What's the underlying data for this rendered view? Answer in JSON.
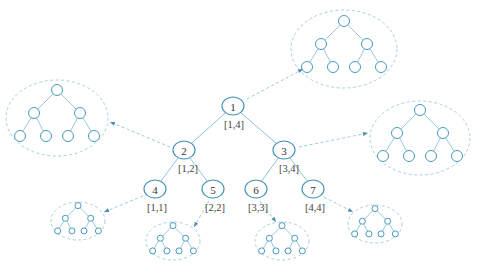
{
  "diagram": {
    "type": "segment-tree",
    "colors": {
      "node_stroke": "#3e8fb8",
      "edge": "#8cc4d6",
      "ellipse_dashed": "#9cc9d8",
      "text": "#333333"
    },
    "nodes": [
      {
        "id": "1",
        "label": "1",
        "range": "[1,4]",
        "x": 233,
        "y": 106
      },
      {
        "id": "2",
        "label": "2",
        "range": "[1,2]",
        "x": 184,
        "y": 150
      },
      {
        "id": "3",
        "label": "3",
        "range": "[3,4]",
        "x": 284,
        "y": 150
      },
      {
        "id": "4",
        "label": "4",
        "range": "[1,1]",
        "x": 155,
        "y": 189
      },
      {
        "id": "5",
        "label": "5",
        "range": "[2,2]",
        "x": 213,
        "y": 189
      },
      {
        "id": "6",
        "label": "6",
        "range": "[3,3]",
        "x": 256,
        "y": 189
      },
      {
        "id": "7",
        "label": "7",
        "range": "[4,4]",
        "x": 313,
        "y": 189
      }
    ],
    "edges": [
      [
        "1",
        "2"
      ],
      [
        "1",
        "3"
      ],
      [
        "2",
        "4"
      ],
      [
        "2",
        "5"
      ],
      [
        "3",
        "6"
      ],
      [
        "3",
        "7"
      ]
    ],
    "inner_trees": [
      {
        "attached_to": "1",
        "cx": 344,
        "cy": 49,
        "rx": 53,
        "ry": 39,
        "scale": 1.0
      },
      {
        "attached_to": "2",
        "cx": 57,
        "cy": 118,
        "rx": 51,
        "ry": 38,
        "scale": 1.0
      },
      {
        "attached_to": "3",
        "cx": 420,
        "cy": 138,
        "rx": 50,
        "ry": 37,
        "scale": 1.0
      },
      {
        "attached_to": "4",
        "cx": 78,
        "cy": 221,
        "rx": 27,
        "ry": 19,
        "scale": 0.55
      },
      {
        "attached_to": "5",
        "cx": 173,
        "cy": 241,
        "rx": 27,
        "ry": 19,
        "scale": 0.55
      },
      {
        "attached_to": "6",
        "cx": 282,
        "cy": 241,
        "rx": 27,
        "ry": 19,
        "scale": 0.55
      },
      {
        "attached_to": "7",
        "cx": 375,
        "cy": 224,
        "rx": 27,
        "ry": 19,
        "scale": 0.55
      }
    ],
    "pointers": [
      {
        "from": "1",
        "x1": 247,
        "y1": 99,
        "x2": 303,
        "y2": 69
      },
      {
        "from": "2",
        "x1": 170,
        "y1": 147,
        "x2": 110,
        "y2": 122
      },
      {
        "from": "3",
        "x1": 299,
        "y1": 147,
        "x2": 368,
        "y2": 133
      },
      {
        "from": "4",
        "x1": 143,
        "y1": 196,
        "x2": 104,
        "y2": 212
      },
      {
        "from": "5",
        "x1": 209,
        "y1": 201,
        "x2": 194,
        "y2": 227
      },
      {
        "from": "6",
        "x1": 260,
        "y1": 201,
        "x2": 276,
        "y2": 222
      },
      {
        "from": "7",
        "x1": 324,
        "y1": 197,
        "x2": 353,
        "y2": 212
      }
    ]
  }
}
